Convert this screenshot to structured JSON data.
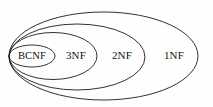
{
  "diagram": {
    "type": "nested-ellipse-venn",
    "background_color": "#fefefe",
    "stroke_color": "#1b1b1b",
    "label_color": "#111111",
    "canvas": {
      "width": 213,
      "height": 107
    },
    "shared_left_tangent": {
      "x": 9,
      "y": 56
    },
    "regions": [
      {
        "id": "bcnf",
        "label": "BCNF",
        "label_x": 32,
        "label_y": 56,
        "ellipse": {
          "cx": 32,
          "cy": 56,
          "rx": 23,
          "ry": 11
        },
        "nesting_level": 4
      },
      {
        "id": "3nf",
        "label": "3NF",
        "label_x": 76,
        "label_y": 56,
        "ellipse": {
          "cx": 53,
          "cy": 56,
          "rx": 44,
          "ry": 23.5
        },
        "nesting_level": 3
      },
      {
        "id": "2nf",
        "label": "2NF",
        "label_x": 122,
        "label_y": 56,
        "ellipse": {
          "cx": 77,
          "cy": 57,
          "rx": 68,
          "ry": 33
        },
        "nesting_level": 2
      },
      {
        "id": "1nf",
        "label": "1NF",
        "label_x": 174,
        "label_y": 56,
        "ellipse": {
          "cx": 103.5,
          "cy": 56,
          "rx": 94.5,
          "ry": 44
        },
        "nesting_level": 1
      }
    ]
  }
}
